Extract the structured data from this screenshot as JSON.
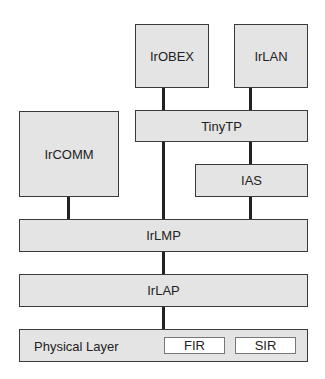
{
  "diagram": {
    "type": "protocol-stack",
    "layers": {
      "irobex": "IrOBEX",
      "irlan": "IrLAN",
      "ircomm": "IrCOMM",
      "tinytp": "TinyTP",
      "ias": "IAS",
      "irlmp": "IrLMP",
      "irlap": "IrLAP",
      "physical": "Physical Layer"
    },
    "physical_sublayers": [
      "FIR",
      "SIR"
    ],
    "connections": [
      [
        "IrOBEX",
        "TinyTP"
      ],
      [
        "IrLAN",
        "TinyTP"
      ],
      [
        "TinyTP",
        "IAS"
      ],
      [
        "TinyTP",
        "IrLMP"
      ],
      [
        "IrCOMM",
        "IrLMP"
      ],
      [
        "IAS",
        "IrLMP"
      ],
      [
        "IrLMP",
        "IrLAP"
      ],
      [
        "IrLAP",
        "Physical Layer"
      ]
    ],
    "colors": {
      "box_fill": "#e4e4e4",
      "box_border": "#3a3a3a",
      "connector": "#222222",
      "sub_fill": "#ffffff"
    }
  }
}
